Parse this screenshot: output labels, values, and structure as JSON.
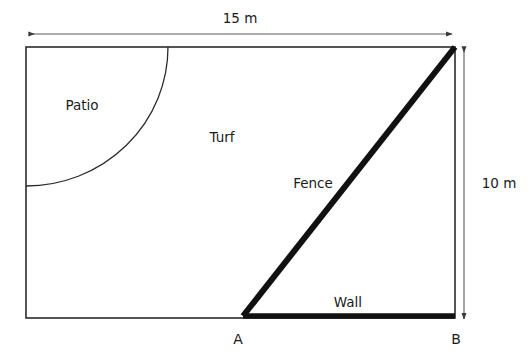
{
  "figure": {
    "colors": {
      "outline": "#2b2b2b",
      "thick_line": "#111111",
      "dimension_line": "#5a5a5a",
      "text": "#1a1a1a",
      "background": "#ffffff"
    },
    "regions": [
      {
        "key": "patio",
        "label": "Patio"
      },
      {
        "key": "turf",
        "label": "Turf"
      }
    ],
    "lines": [
      {
        "key": "fence",
        "label": "Fence"
      },
      {
        "key": "wall",
        "label": "Wall"
      }
    ],
    "points": [
      {
        "key": "a",
        "label": "A"
      },
      {
        "key": "b",
        "label": "B"
      }
    ],
    "dimensions": [
      {
        "key": "width",
        "label": "15 m",
        "value": 15,
        "unit": "m",
        "orientation": "horizontal"
      },
      {
        "key": "height",
        "label": "10 m",
        "value": 10,
        "unit": "m",
        "orientation": "vertical"
      }
    ]
  },
  "labels": {
    "patio": "Patio",
    "turf": "Turf",
    "fence": "Fence",
    "wall": "Wall",
    "point_a": "A",
    "point_b": "B",
    "width_dim": "15 m",
    "height_dim": "10 m"
  }
}
